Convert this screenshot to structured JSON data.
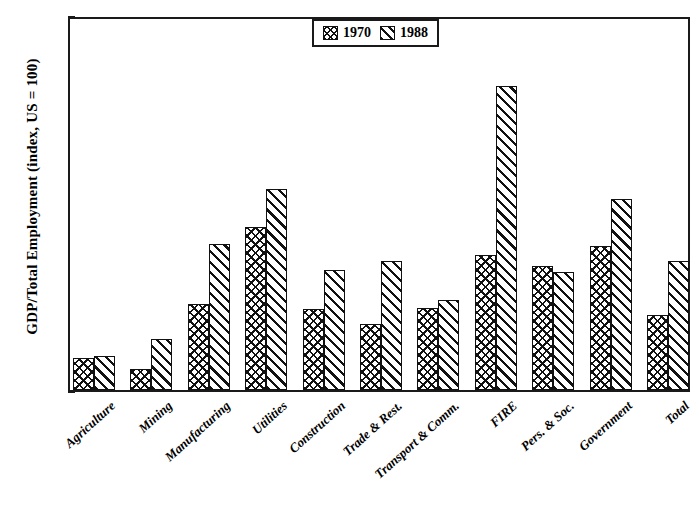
{
  "chart_data": {
    "type": "bar",
    "title": "",
    "xlabel": "",
    "ylabel": "GDP/Total Employment (index, US = 100)",
    "ylim": [
      0,
      200
    ],
    "yticks": [
      0,
      50,
      100,
      150,
      200
    ],
    "grid": false,
    "legend_position": "top-center",
    "categories": [
      "Agriculture",
      "Mining",
      "Manufacturing",
      "Utilities",
      "Construction",
      "Trade & Rest.",
      "Transport & Comm.",
      "FIRE",
      "Pers. & Soc.",
      "Government",
      "Total"
    ],
    "series": [
      {
        "name": "1970",
        "pattern": "crosshatch",
        "values": [
          17,
          11,
          46,
          87,
          43,
          35,
          44,
          72,
          66,
          77,
          40
        ]
      },
      {
        "name": "1988",
        "pattern": "diagonal",
        "values": [
          18,
          27,
          78,
          107,
          64,
          69,
          48,
          162,
          63,
          102,
          69
        ]
      }
    ]
  },
  "legend": {
    "entries": [
      {
        "label": "1970"
      },
      {
        "label": "1988"
      }
    ]
  }
}
